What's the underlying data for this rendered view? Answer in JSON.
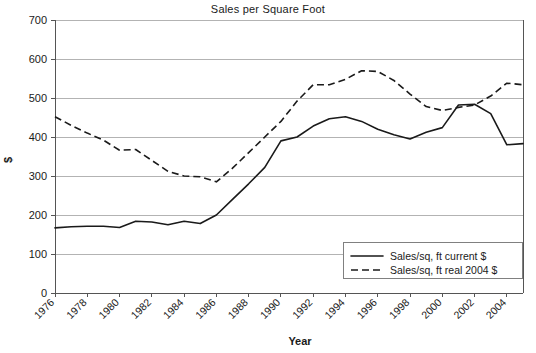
{
  "chart_data": {
    "type": "line",
    "title": "Sales per Square Foot",
    "xlabel": "Year",
    "ylabel": "$",
    "xlim": [
      1976,
      2005
    ],
    "ylim": [
      0,
      700
    ],
    "ytick_step": 100,
    "grid": true,
    "legend_position": "bottom-right",
    "yticks": [
      "0",
      "100",
      "200",
      "300",
      "400",
      "500",
      "600",
      "700"
    ],
    "xticks": [
      "1976",
      "1978",
      "1980",
      "1982",
      "1984",
      "1986",
      "1988",
      "1990",
      "1992",
      "1994",
      "1996",
      "1998",
      "2000",
      "2002",
      "2004"
    ],
    "x": [
      1976,
      1977,
      1978,
      1979,
      1980,
      1981,
      1982,
      1983,
      1984,
      1985,
      1986,
      1987,
      1988,
      1989,
      1990,
      1991,
      1992,
      1993,
      1994,
      1995,
      1996,
      1997,
      1998,
      1999,
      2000,
      2001,
      2002,
      2003,
      2004,
      2005
    ],
    "series": [
      {
        "name": "Sales/sq, ft current $",
        "style": "solid",
        "color": "#1a1a1a",
        "values": [
          167,
          170,
          171,
          171,
          168,
          184,
          182,
          175,
          184,
          178,
          200,
          240,
          280,
          322,
          390,
          400,
          428,
          447,
          452,
          440,
          420,
          406,
          395,
          412,
          424,
          482,
          484,
          460,
          380,
          383
        ]
      },
      {
        "name": "Sales/sq, ft real 2004 $",
        "style": "dashed",
        "color": "#1a1a1a",
        "values": [
          452,
          430,
          410,
          392,
          366,
          368,
          340,
          312,
          300,
          298,
          285,
          320,
          360,
          400,
          440,
          492,
          534,
          534,
          548,
          570,
          568,
          545,
          510,
          478,
          468,
          476,
          482,
          505,
          538,
          534
        ]
      }
    ],
    "series_tail_x": [
      2000,
      2001,
      2002,
      2003,
      2004,
      2005
    ],
    "solid_tail": [
      484,
      460,
      380,
      383,
      388,
      420,
      442,
      445
    ],
    "dashed_tail": [
      538,
      534,
      470,
      402,
      400,
      410,
      432,
      444
    ]
  },
  "legend": {
    "entries": [
      {
        "label": "Sales/sq, ft current $",
        "style": "solid"
      },
      {
        "label": "Sales/sq, ft real 2004 $",
        "style": "dashed"
      }
    ]
  }
}
